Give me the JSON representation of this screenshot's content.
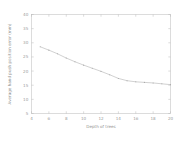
{
  "chart_data": {
    "type": "line",
    "title": "",
    "xlabel": "Depth of trees",
    "ylabel": "Average hand push position error (mm)",
    "xlim": [
      4,
      20
    ],
    "ylim": [
      5,
      40
    ],
    "xticks": [
      4,
      6,
      8,
      10,
      12,
      14,
      16,
      18,
      20
    ],
    "xtick_labels": [
      "4",
      "6",
      "8",
      "10",
      "12",
      "14",
      "16",
      "18",
      "20"
    ],
    "yticks": [
      5,
      10,
      15,
      20,
      25,
      30,
      35,
      40
    ],
    "ytick_labels": [
      "5",
      "10",
      "15",
      "20",
      "25",
      "30",
      "35",
      "40"
    ],
    "grid": false,
    "legend": false,
    "series": [
      {
        "name": "average hand push position error",
        "color": "#b2b2b2",
        "marker": "point",
        "x": [
          5,
          6,
          7,
          8,
          9,
          10,
          11,
          12,
          13,
          14,
          15,
          16,
          17,
          18,
          19,
          20
        ],
        "y": [
          28.6,
          27.4,
          26.1,
          24.6,
          23.3,
          22.1,
          21.0,
          19.9,
          18.7,
          17.4,
          16.6,
          16.2,
          16.0,
          15.8,
          15.5,
          15.2
        ]
      }
    ]
  }
}
